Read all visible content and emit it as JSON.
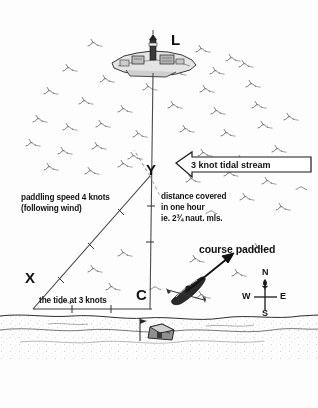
{
  "diagram": {
    "background_color": "#fdfdfd",
    "ink_color": "#111111",
    "vertices": {
      "L": "L",
      "X": "X",
      "Y": "Y",
      "C": "C"
    },
    "labels": {
      "paddling_speed_line1": "paddling speed 4 knots",
      "paddling_speed_line2": "(following wind)",
      "distance_line1": "distance covered",
      "distance_line2": "in one hour",
      "distance_line3": "ie. 2¾ naut. mls.",
      "tide_label": "the tide at 3 knots",
      "course_paddled": "course paddled",
      "tidal_stream": "3 knot tidal stream"
    },
    "compass": {
      "north": "N",
      "south": "S",
      "east": "E",
      "west": "W"
    },
    "icons": {
      "island": "lighthouse-island-icon",
      "kayak": "kayak-icon",
      "hut": "beach-hut-icon",
      "flag": "flagpole-icon",
      "stream_arrow": "left-arrow-banner-icon",
      "course_arrow": "course-arrow-icon",
      "compass_rose": "compass-rose-icon",
      "waves": "wave-texture-icon",
      "shore": "shoreline-icon"
    },
    "geometry": {
      "tide_vector_knots": 3,
      "paddling_vector_knots": 4,
      "resultant_naut_miles": "2¾",
      "tide_vector_ticks": 2,
      "paddling_vector_ticks": 3,
      "resultant_vector_ticks": 2
    }
  }
}
